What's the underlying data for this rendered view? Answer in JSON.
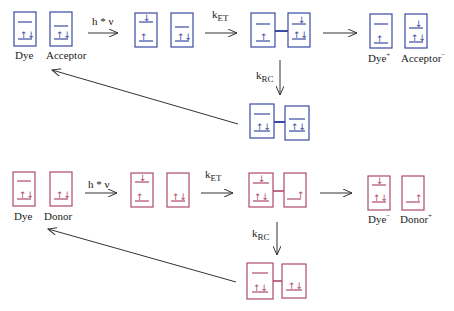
{
  "colors": {
    "acceptor_row": "#3a4aa0",
    "donor_row": "#b04a6a",
    "arrow": "#333333"
  },
  "top_row": {
    "labels": {
      "dye": "Dye",
      "acceptor": "Acceptor",
      "dye_plus": "Dye",
      "dye_plus_sup": "+",
      "acceptor_minus": "Acceptor",
      "acceptor_minus_sup": "−"
    },
    "excitation": "h * ν",
    "k_et": "k",
    "k_et_sub": "ET",
    "k_rc": "k",
    "k_rc_sub": "RC"
  },
  "bottom_row": {
    "labels": {
      "dye": "Dye",
      "donor": "Donor",
      "dye_minus": "Dye",
      "dye_minus_sup": "−",
      "donor_plus": "Donor",
      "donor_plus_sup": "+"
    },
    "excitation": "h * ν",
    "k_et": "k",
    "k_et_sub": "ET",
    "k_rc": "k",
    "k_rc_sub": "RC"
  }
}
